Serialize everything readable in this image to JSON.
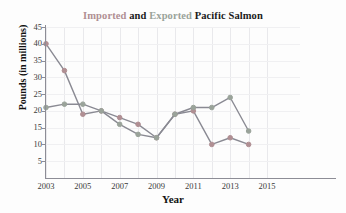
{
  "title": {
    "part_imported": "Imported",
    "part_and": "and",
    "part_exported": "Exported",
    "part_subject": "Pacific Salmon",
    "full": "Imported and Exported Pacific Salmon"
  },
  "colors": {
    "imported": "#b08f93",
    "exported": "#9aa39a",
    "series_line": "#8a8a93",
    "axis": "#8d8d96",
    "grid": "#e9e9ec",
    "text": "#1a1a1a",
    "background": "#fdfdfd"
  },
  "chart_data": {
    "type": "line",
    "title": "Imported and Exported Pacific Salmon",
    "xlabel": "Year",
    "ylabel": "Pounds (in millions)",
    "x": [
      2003,
      2004,
      2005,
      2006,
      2007,
      2008,
      2009,
      2010,
      2011,
      2012,
      2013,
      2014
    ],
    "xlim": [
      2003,
      2015
    ],
    "ylim": [
      0,
      45
    ],
    "xticks": [
      "2003",
      "2005",
      "2007",
      "2009",
      "2011",
      "2013",
      "2015"
    ],
    "xtick_values": [
      2003,
      2005,
      2007,
      2009,
      2011,
      2013,
      2015
    ],
    "yticks": [
      "5",
      "10",
      "15",
      "20",
      "25",
      "30",
      "35",
      "40",
      "45"
    ],
    "ytick_values": [
      5,
      10,
      15,
      20,
      25,
      30,
      35,
      40,
      45
    ],
    "grid": true,
    "legend": "in-title",
    "series": [
      {
        "name": "Imported",
        "color": "#b08f93",
        "values": [
          40,
          32,
          19,
          20,
          18,
          16,
          12,
          19,
          20,
          10,
          12,
          10
        ]
      },
      {
        "name": "Exported",
        "color": "#9aa39a",
        "values": [
          21,
          22,
          22,
          20,
          16,
          13,
          12,
          19,
          21,
          21,
          24,
          14
        ]
      }
    ]
  }
}
